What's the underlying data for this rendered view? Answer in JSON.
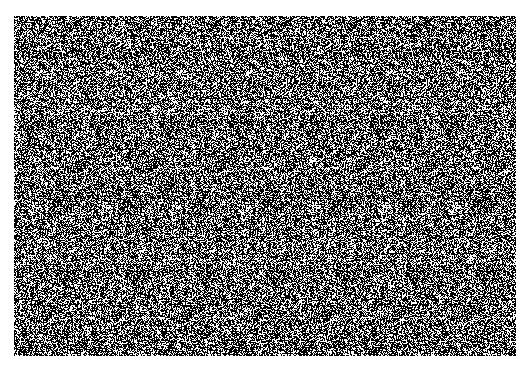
{
  "image": {
    "kind": "random-dot stereogram",
    "colors": {
      "foreground": "#ffffff",
      "background": "#000000",
      "page": "#ffffff"
    },
    "region": {
      "x": 14,
      "y": 16,
      "width": 502,
      "height": 340
    }
  }
}
